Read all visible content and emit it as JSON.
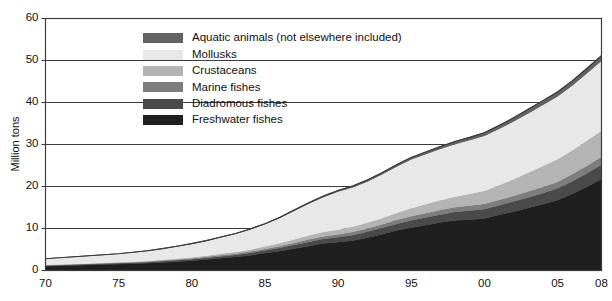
{
  "chart_data": {
    "type": "area",
    "stacked": true,
    "title": "",
    "xlabel": "",
    "ylabel": "Million tons",
    "xlim": [
      1970,
      2008
    ],
    "ylim": [
      0,
      60
    ],
    "y_ticks": [
      0,
      10,
      20,
      30,
      40,
      50,
      60
    ],
    "y_tick_labels": [
      "0",
      "10",
      "20",
      "30",
      "40",
      "50",
      "60"
    ],
    "x_ticks": [
      1970,
      1975,
      1980,
      1985,
      1990,
      1995,
      2000,
      2005,
      2008
    ],
    "x_tick_labels": [
      "70",
      "75",
      "80",
      "85",
      "90",
      "95",
      "00",
      "05",
      "08"
    ],
    "grid": "horizontal",
    "legend_position": "upper-left-inside",
    "x": [
      1970,
      1971,
      1972,
      1973,
      1974,
      1975,
      1976,
      1977,
      1978,
      1979,
      1980,
      1981,
      1982,
      1983,
      1984,
      1985,
      1986,
      1987,
      1988,
      1989,
      1990,
      1991,
      1992,
      1993,
      1994,
      1995,
      1996,
      1997,
      1998,
      1999,
      2000,
      2001,
      2002,
      2003,
      2004,
      2005,
      2006,
      2007,
      2008
    ],
    "series": [
      {
        "name": "Freshwater fishes",
        "color": "#1f1f1f",
        "values": [
          1.0,
          1.1,
          1.2,
          1.3,
          1.4,
          1.5,
          1.6,
          1.7,
          1.9,
          2.1,
          2.3,
          2.6,
          2.9,
          3.2,
          3.6,
          4.1,
          4.6,
          5.2,
          5.8,
          6.4,
          6.7,
          7.1,
          7.8,
          8.6,
          9.5,
          10.2,
          10.8,
          11.4,
          11.9,
          12.1,
          12.4,
          13.2,
          14.0,
          14.9,
          15.8,
          16.7,
          18.2,
          19.9,
          21.7
        ]
      },
      {
        "name": "Diadromous fishes",
        "color": "#4a4a4a",
        "values": [
          0.15,
          0.16,
          0.17,
          0.18,
          0.2,
          0.22,
          0.24,
          0.26,
          0.29,
          0.32,
          0.36,
          0.4,
          0.45,
          0.5,
          0.56,
          0.64,
          0.74,
          0.86,
          1.0,
          1.1,
          1.2,
          1.3,
          1.4,
          1.5,
          1.6,
          1.7,
          1.8,
          1.9,
          2.0,
          2.1,
          2.2,
          2.3,
          2.4,
          2.5,
          2.6,
          2.8,
          3.0,
          3.2,
          3.4
        ]
      },
      {
        "name": "Marine fishes",
        "color": "#7d7d7d",
        "values": [
          0.1,
          0.1,
          0.11,
          0.12,
          0.13,
          0.14,
          0.15,
          0.16,
          0.18,
          0.2,
          0.22,
          0.25,
          0.28,
          0.31,
          0.35,
          0.4,
          0.45,
          0.5,
          0.56,
          0.62,
          0.68,
          0.74,
          0.8,
          0.86,
          0.92,
          1.0,
          1.05,
          1.1,
          1.15,
          1.2,
          1.25,
          1.3,
          1.35,
          1.4,
          1.5,
          1.6,
          1.7,
          1.8,
          1.9
        ]
      },
      {
        "name": "Crustaceans",
        "color": "#b4b4b4",
        "values": [
          0.04,
          0.05,
          0.06,
          0.07,
          0.08,
          0.1,
          0.12,
          0.14,
          0.17,
          0.2,
          0.24,
          0.28,
          0.33,
          0.39,
          0.46,
          0.55,
          0.68,
          0.82,
          0.95,
          1.05,
          1.15,
          1.25,
          1.35,
          1.5,
          1.7,
          1.9,
          2.1,
          2.3,
          2.5,
          2.8,
          3.1,
          3.5,
          4.0,
          4.5,
          5.0,
          5.4,
          5.7,
          6.0,
          6.3
        ]
      },
      {
        "name": "Mollusks",
        "color": "#e8e8e8",
        "values": [
          1.5,
          1.6,
          1.7,
          1.8,
          1.9,
          2.0,
          2.2,
          2.4,
          2.6,
          2.9,
          3.2,
          3.5,
          3.9,
          4.3,
          4.8,
          5.3,
          6.0,
          6.8,
          7.6,
          8.3,
          9.0,
          9.4,
          9.8,
          10.4,
          11.0,
          11.6,
          11.9,
          12.2,
          12.5,
          12.8,
          13.1,
          13.4,
          13.7,
          14.1,
          14.5,
          14.9,
          15.4,
          16.0,
          16.6
        ]
      },
      {
        "name": "Aquatic animals (not elsewhere included)",
        "color": "#636363",
        "values": [
          0.02,
          0.02,
          0.03,
          0.03,
          0.04,
          0.04,
          0.05,
          0.05,
          0.06,
          0.07,
          0.08,
          0.09,
          0.1,
          0.11,
          0.13,
          0.15,
          0.17,
          0.2,
          0.23,
          0.26,
          0.3,
          0.34,
          0.38,
          0.42,
          0.46,
          0.5,
          0.55,
          0.6,
          0.65,
          0.7,
          0.75,
          0.82,
          0.9,
          0.98,
          1.05,
          1.1,
          1.15,
          1.2,
          1.25
        ]
      }
    ],
    "legend": [
      {
        "label": "Aquatic animals (not elsewhere included)",
        "color": "#636363"
      },
      {
        "label": "Mollusks",
        "color": "#e8e8e8"
      },
      {
        "label": "Crustaceans",
        "color": "#b4b4b4"
      },
      {
        "label": "Marine fishes",
        "color": "#7d7d7d"
      },
      {
        "label": "Diadromous fishes",
        "color": "#4a4a4a"
      },
      {
        "label": "Freshwater fishes",
        "color": "#1f1f1f"
      }
    ],
    "colors": {
      "frame": "#3c3c3c",
      "gridline": "#3c3c3c",
      "text": "#111111",
      "background": "#ffffff"
    }
  }
}
